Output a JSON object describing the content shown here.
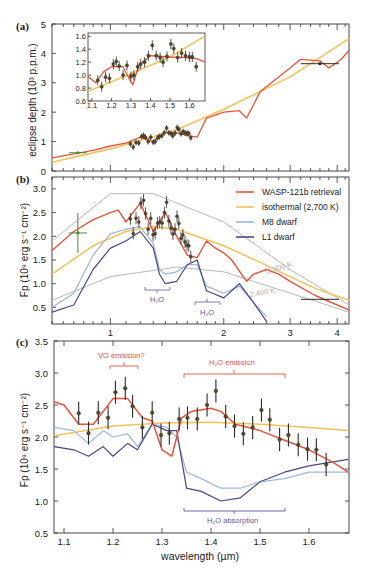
{
  "colors": {
    "retrieval": "#e8543a",
    "isothermal": "#f2c25c",
    "m8": "#9db6dc",
    "l1": "#4a4785",
    "bb": "#b8b8b8",
    "data": "#2b2b2b",
    "dataFill": "#5a4a20",
    "annotRed": "#e8543a",
    "annotBlue": "#5b5aa0"
  },
  "panels": {
    "a": {
      "label": "(a)",
      "ylabel": "eclipse depth (10³ p.p.m.)",
      "yticks": [
        "0",
        "1",
        "2",
        "3",
        "4",
        "5"
      ],
      "inset": {
        "yticks": [
          "0.6",
          "0.8",
          "1.0",
          "1.2",
          "1.4",
          "1.6"
        ],
        "xticks": [
          "1.1",
          "1.2",
          "1.3",
          "1.4",
          "1.5",
          "1.6"
        ]
      }
    },
    "b": {
      "label": "(b)",
      "ylabel": "Fp (10⁹ erg s⁻¹ cm⁻²)",
      "yticks": [
        "0.5",
        "1.0",
        "1.5",
        "2.0",
        "2.5",
        "3.0"
      ],
      "xticks": [
        "1",
        "2",
        "3",
        "4"
      ],
      "legend": [
        {
          "label": "WASP-121b retrieval",
          "key": "retrieval"
        },
        {
          "label": "isothermal (2,700 K)",
          "key": "isothermal"
        },
        {
          "label": "M8 dwarf",
          "key": "m8"
        },
        {
          "label": "L1 dwarf",
          "key": "l1"
        }
      ],
      "annotations": {
        "bb_hot": "2,900 K",
        "bb_cold": "2,400 K",
        "h2o_1": "H₂O",
        "h2o_2": "H₂O"
      }
    },
    "c": {
      "label": "(c)",
      "ylabel": "Fp (10⁹ erg s⁻¹ cm⁻²)",
      "yticks": [
        "0.5",
        "1.0",
        "1.5",
        "2.0",
        "2.5",
        "3.0",
        "3.5"
      ],
      "xticks": [
        "1.1",
        "1.2",
        "1.3",
        "1.4",
        "1.5",
        "1.6"
      ],
      "xlabel": "wavelength (µm)",
      "annotations": {
        "vo": "VO emission?",
        "h2o_em": "H₂O emission",
        "h2o_abs": "H₂O absorption"
      }
    }
  },
  "chart_data": [
    {
      "type": "line",
      "title": "(a) eclipse depth",
      "xlabel": "wavelength (µm, log scale)",
      "ylabel": "eclipse depth (10³ p.p.m.)",
      "ylim": [
        0,
        5
      ],
      "xlim": [
        0.7,
        4.3
      ],
      "series": [
        {
          "name": "WASP-121b retrieval",
          "x": [
            0.7,
            0.9,
            1.0,
            1.1,
            1.15,
            1.2,
            1.3,
            1.4,
            1.5,
            1.6,
            1.7,
            1.8,
            2.0,
            2.2,
            2.3,
            2.5,
            3.0,
            3.2,
            3.6,
            3.8,
            4.1,
            4.3
          ],
          "y": [
            0.45,
            0.7,
            0.85,
            0.95,
            1.05,
            1.15,
            1.0,
            1.32,
            1.3,
            1.2,
            1.15,
            1.8,
            2.0,
            2.05,
            1.8,
            2.7,
            3.5,
            3.8,
            3.75,
            3.5,
            3.8,
            4.1
          ]
        },
        {
          "name": "isothermal (2,700 K)",
          "x": [
            0.7,
            1.0,
            1.5,
            2.0,
            3.0,
            4.3
          ],
          "y": [
            0.3,
            0.75,
            1.4,
            2.1,
            3.2,
            4.5
          ]
        }
      ],
      "points": [
        {
          "x": 0.82,
          "y": 0.62
        },
        {
          "x": 3.6,
          "y": 3.65
        }
      ]
    },
    {
      "type": "scatter",
      "title": "(a) inset",
      "xlim": [
        1.08,
        1.68
      ],
      "ylim": [
        0.6,
        1.65
      ],
      "x": [
        1.13,
        1.15,
        1.17,
        1.19,
        1.21,
        1.225,
        1.24,
        1.26,
        1.28,
        1.3,
        1.315,
        1.335,
        1.35,
        1.37,
        1.39,
        1.41,
        1.43,
        1.45,
        1.465,
        1.485,
        1.505,
        1.52,
        1.54,
        1.56,
        1.58,
        1.6,
        1.615,
        1.635
      ],
      "y": [
        0.92,
        0.82,
        0.97,
        0.95,
        1.17,
        1.21,
        1.14,
        1.0,
        1.15,
        0.98,
        1.0,
        1.13,
        1.17,
        1.2,
        1.3,
        1.46,
        1.3,
        1.27,
        1.2,
        1.29,
        1.48,
        1.41,
        1.27,
        1.34,
        1.3,
        1.28,
        1.28,
        1.13
      ]
    },
    {
      "type": "line",
      "title": "(b)",
      "xlabel": "wavelength (µm, log scale)",
      "ylabel": "Fp (10⁹ erg s⁻¹ cm⁻²)",
      "ylim": [
        0.15,
        3.25
      ],
      "xlim": [
        0.7,
        4.3
      ],
      "series": [
        {
          "name": "WASP-121b retrieval",
          "x": [
            0.7,
            0.8,
            0.9,
            1.0,
            1.05,
            1.1,
            1.2,
            1.3,
            1.4,
            1.5,
            1.6,
            1.7,
            1.8,
            1.9,
            2.0,
            2.1,
            2.3,
            2.4,
            2.6,
            2.8,
            3.0,
            3.5,
            4.0,
            4.3
          ],
          "y": [
            1.7,
            2.1,
            2.35,
            2.5,
            2.55,
            2.3,
            2.7,
            2.1,
            2.5,
            2.0,
            1.6,
            1.55,
            1.9,
            1.75,
            1.65,
            1.5,
            1.05,
            1.2,
            1.3,
            1.2,
            1.05,
            0.75,
            0.55,
            0.45
          ]
        },
        {
          "name": "isothermal (2,700 K)",
          "x": [
            0.7,
            0.9,
            1.1,
            1.3,
            1.5,
            2.0,
            2.5,
            3.0,
            3.5,
            4.3
          ],
          "y": [
            1.2,
            1.8,
            2.1,
            2.2,
            2.15,
            1.8,
            1.45,
            1.15,
            0.9,
            0.65
          ]
        },
        {
          "name": "M8 dwarf",
          "x": [
            0.7,
            0.8,
            0.9,
            1.0,
            1.1,
            1.2,
            1.3,
            1.35,
            1.4,
            1.5,
            1.6,
            1.7,
            1.8,
            2.0,
            2.2,
            2.4,
            2.6
          ],
          "y": [
            0.5,
            0.8,
            1.6,
            2.05,
            2.15,
            2.2,
            1.85,
            1.3,
            1.2,
            1.25,
            1.4,
            1.4,
            0.95,
            0.8,
            0.95,
            0.6,
            0.3
          ]
        },
        {
          "name": "L1 dwarf",
          "x": [
            0.7,
            0.8,
            0.9,
            1.0,
            1.1,
            1.2,
            1.3,
            1.35,
            1.4,
            1.5,
            1.6,
            1.7,
            1.8,
            2.0,
            2.2,
            2.4,
            2.6
          ],
          "y": [
            0.4,
            0.55,
            1.3,
            1.75,
            1.9,
            2.1,
            1.75,
            1.2,
            1.0,
            1.05,
            1.4,
            1.5,
            0.85,
            0.7,
            1.0,
            0.6,
            0.2
          ]
        },
        {
          "name": "blackbody 2,900 K",
          "x": [
            0.7,
            1.0,
            1.3,
            2.0,
            3.0,
            4.3
          ],
          "y": [
            1.9,
            2.9,
            2.9,
            2.3,
            1.3,
            0.55
          ]
        },
        {
          "name": "blackbody 2,400 K",
          "x": [
            0.7,
            1.0,
            1.5,
            2.0,
            3.0,
            4.3
          ],
          "y": [
            0.65,
            1.15,
            1.35,
            1.25,
            0.8,
            0.4
          ]
        }
      ]
    },
    {
      "type": "line",
      "title": "(c)",
      "xlabel": "wavelength (µm)",
      "ylabel": "Fp (10⁹ erg s⁻¹ cm⁻²)",
      "ylim": [
        0.5,
        3.5
      ],
      "xlim": [
        1.08,
        1.68
      ],
      "series": [
        {
          "name": "WASP-121b retrieval",
          "x": [
            1.08,
            1.1,
            1.13,
            1.16,
            1.2,
            1.23,
            1.26,
            1.28,
            1.3,
            1.32,
            1.34,
            1.36,
            1.4,
            1.42,
            1.45,
            1.5,
            1.55,
            1.6,
            1.65,
            1.68
          ],
          "y": [
            2.55,
            2.5,
            2.2,
            2.2,
            2.6,
            2.6,
            2.3,
            2.25,
            1.8,
            1.7,
            2.3,
            2.4,
            2.45,
            2.4,
            2.2,
            2.1,
            1.95,
            1.8,
            1.6,
            1.45
          ]
        },
        {
          "name": "isothermal (2,700 K)",
          "x": [
            1.08,
            1.2,
            1.3,
            1.4,
            1.5,
            1.6,
            1.68
          ],
          "y": [
            2.02,
            2.17,
            2.22,
            2.23,
            2.2,
            2.15,
            2.1
          ]
        },
        {
          "name": "M8 dwarf",
          "x": [
            1.08,
            1.12,
            1.15,
            1.18,
            1.2,
            1.23,
            1.25,
            1.28,
            1.31,
            1.33,
            1.35,
            1.38,
            1.42,
            1.46,
            1.5,
            1.55,
            1.6,
            1.68
          ],
          "y": [
            2.15,
            2.1,
            1.9,
            2.1,
            2.0,
            2.05,
            1.85,
            2.2,
            2.15,
            2.0,
            1.45,
            1.35,
            1.2,
            1.2,
            1.3,
            1.35,
            1.45,
            1.45
          ]
        },
        {
          "name": "L1 dwarf",
          "x": [
            1.08,
            1.12,
            1.15,
            1.18,
            1.2,
            1.23,
            1.25,
            1.28,
            1.31,
            1.33,
            1.35,
            1.38,
            1.42,
            1.46,
            1.5,
            1.55,
            1.6,
            1.68
          ],
          "y": [
            1.85,
            1.8,
            1.7,
            1.85,
            1.7,
            1.9,
            1.8,
            2.2,
            2.1,
            2.1,
            1.2,
            1.15,
            1.0,
            1.05,
            1.3,
            1.45,
            1.55,
            1.65
          ]
        }
      ],
      "points": {
        "x": [
          1.13,
          1.15,
          1.17,
          1.19,
          1.205,
          1.225,
          1.24,
          1.26,
          1.28,
          1.298,
          1.315,
          1.335,
          1.352,
          1.372,
          1.392,
          1.41,
          1.43,
          1.448,
          1.466,
          1.485,
          1.503,
          1.52,
          1.54,
          1.558,
          1.578,
          1.597,
          1.615,
          1.635
        ],
        "y": [
          2.37,
          2.06,
          2.38,
          2.3,
          2.7,
          2.76,
          2.48,
          2.15,
          2.38,
          2.03,
          2.06,
          2.28,
          2.3,
          2.28,
          2.5,
          2.72,
          2.32,
          2.17,
          2.05,
          2.15,
          2.42,
          2.27,
          1.96,
          2.03,
          1.88,
          1.81,
          1.8,
          1.57
        ],
        "err": 0.18
      }
    }
  ]
}
